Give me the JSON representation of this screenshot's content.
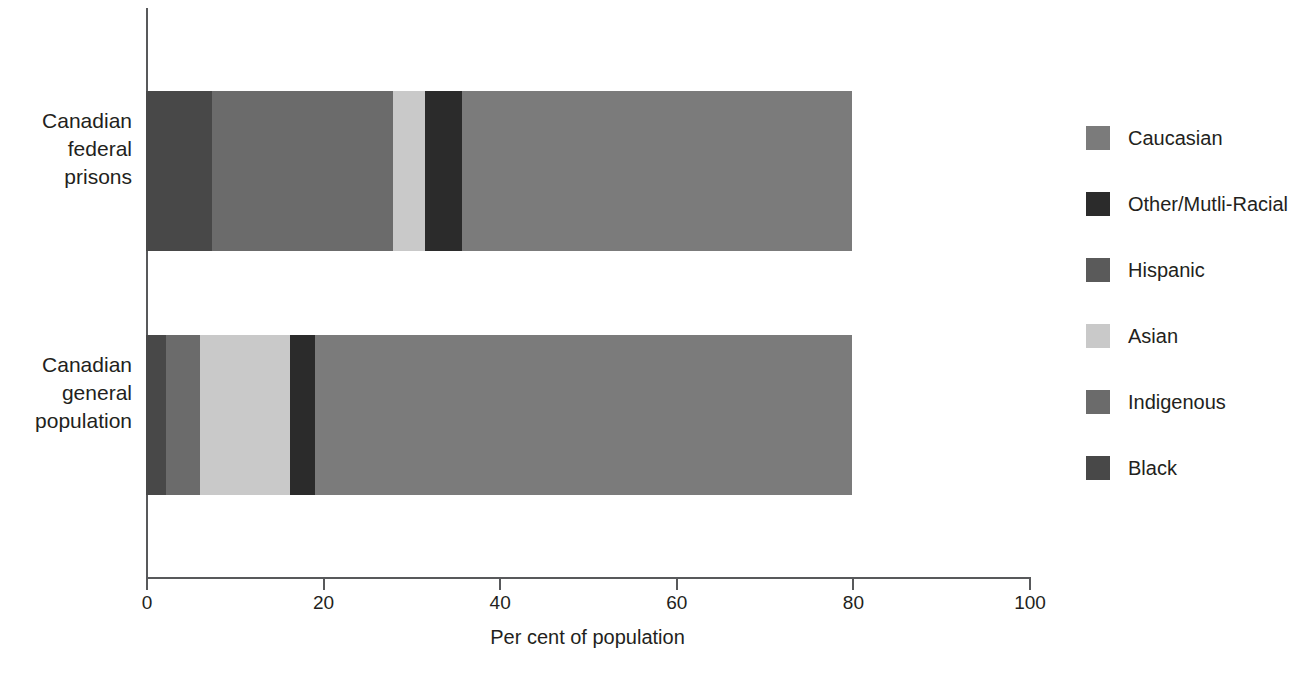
{
  "chart_data": {
    "type": "bar",
    "orientation": "horizontal",
    "stacked": true,
    "title": "",
    "xlabel": "Per cent of population",
    "ylabel": "",
    "xlim": [
      0,
      100
    ],
    "xticks": [
      0,
      20,
      40,
      60,
      80,
      100
    ],
    "xtick_labels": [
      "0",
      "20",
      "40",
      "60",
      "80",
      "100"
    ],
    "grid": false,
    "legend_position": "right",
    "categories": [
      "Canadian federal prisons",
      "Canadian general population"
    ],
    "series": [
      {
        "name": "Black",
        "color": "#484848",
        "values": [
          7.5,
          2.3
        ]
      },
      {
        "name": "Indigenous",
        "color": "#6b6b6b",
        "values": [
          20.5,
          3.8
        ]
      },
      {
        "name": "Asian",
        "color": "#c9c9c9",
        "values": [
          3.6,
          10.2
        ]
      },
      {
        "name": "Other/Mutli-Racial",
        "color": "#2b2b2b",
        "values": [
          4.2,
          2.8
        ]
      },
      {
        "name": "Caucasian",
        "color": "#7b7b7b",
        "values": [
          44.2,
          60.9
        ]
      }
    ],
    "legend_entries": [
      {
        "label": "Caucasian",
        "color": "#7b7b7b"
      },
      {
        "label": "Other/Mutli-Racial",
        "color": "#2b2b2b"
      },
      {
        "label": "Hispanic",
        "color": "#5a5a5a"
      },
      {
        "label": "Asian",
        "color": "#c9c9c9"
      },
      {
        "label": "Indigenous",
        "color": "#6b6b6b"
      },
      {
        "label": "Black",
        "color": "#484848"
      }
    ],
    "axis_color": "#58595b"
  }
}
